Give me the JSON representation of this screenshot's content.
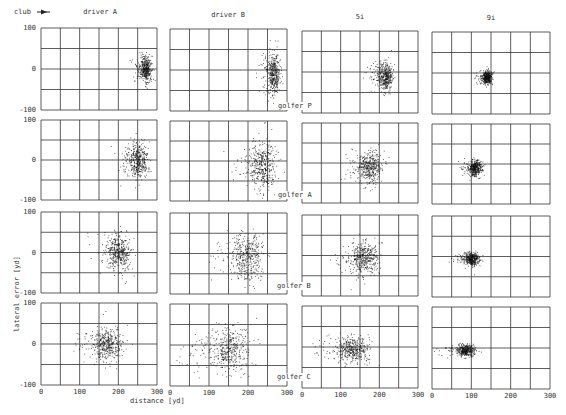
{
  "header": {
    "club_label": "club",
    "club_arrow_icon": "arrow-left-icon"
  },
  "columns": [
    {
      "label": "driver A"
    },
    {
      "label": "driver B"
    },
    {
      "label": "5i"
    },
    {
      "label": "9i"
    }
  ],
  "rows": [
    {
      "label": "golfer P"
    },
    {
      "label": "golfer A"
    },
    {
      "label": "golfer B"
    },
    {
      "label": "golfer C"
    }
  ],
  "axes": {
    "xlabel": "distance [yd]",
    "ylabel": "lateral error [yd]",
    "xticks": [
      "0",
      "100",
      "200",
      "300"
    ],
    "yticks": [
      "100",
      "0",
      "-100"
    ]
  },
  "colors": {
    "grid": "#333333",
    "points": "#111111",
    "background": "#ffffff"
  },
  "chart_data": {
    "type": "scatter",
    "title": "",
    "xlabel": "distance [yd]",
    "ylabel": "lateral error [yd]",
    "xlim": [
      0,
      300
    ],
    "ylim": [
      -100,
      100
    ],
    "x_grid_step": 50,
    "y_grid_step": 50,
    "grid": true,
    "layout": "4x4 small multiples; rows = golfers, columns = clubs",
    "row_labels": [
      "golfer P",
      "golfer A",
      "golfer B",
      "golfer C"
    ],
    "column_labels": [
      "driver A",
      "driver B",
      "5i",
      "9i"
    ],
    "annotations": [
      "club ←"
    ],
    "panels": [
      {
        "golfer": "golfer P",
        "club": "driver A",
        "center_x": 270,
        "center_y": 0,
        "spread_x": 8,
        "spread_y": 15
      },
      {
        "golfer": "golfer P",
        "club": "driver B",
        "center_x": 265,
        "center_y": -10,
        "spread_x": 8,
        "spread_y": 25
      },
      {
        "golfer": "golfer P",
        "club": "5i",
        "center_x": 215,
        "center_y": -10,
        "spread_x": 10,
        "spread_y": 18
      },
      {
        "golfer": "golfer P",
        "club": "9i",
        "center_x": 140,
        "center_y": -10,
        "spread_x": 6,
        "spread_y": 8
      },
      {
        "golfer": "golfer A",
        "club": "driver A",
        "center_x": 250,
        "center_y": 0,
        "spread_x": 12,
        "spread_y": 22
      },
      {
        "golfer": "golfer A",
        "club": "driver B",
        "center_x": 235,
        "center_y": -10,
        "spread_x": 18,
        "spread_y": 30
      },
      {
        "golfer": "golfer A",
        "club": "5i",
        "center_x": 175,
        "center_y": -10,
        "spread_x": 14,
        "spread_y": 22
      },
      {
        "golfer": "golfer A",
        "club": "9i",
        "center_x": 110,
        "center_y": -10,
        "spread_x": 8,
        "spread_y": 10
      },
      {
        "golfer": "golfer B",
        "club": "driver A",
        "center_x": 200,
        "center_y": 0,
        "spread_x": 15,
        "spread_y": 22
      },
      {
        "golfer": "golfer B",
        "club": "driver B",
        "center_x": 195,
        "center_y": -5,
        "spread_x": 20,
        "spread_y": 30
      },
      {
        "golfer": "golfer B",
        "club": "5i",
        "center_x": 160,
        "center_y": -5,
        "spread_x": 18,
        "spread_y": 22
      },
      {
        "golfer": "golfer B",
        "club": "9i",
        "center_x": 100,
        "center_y": -5,
        "spread_x": 10,
        "spread_y": 8
      },
      {
        "golfer": "golfer C",
        "club": "driver A",
        "center_x": 170,
        "center_y": 0,
        "spread_x": 18,
        "spread_y": 20
      },
      {
        "golfer": "golfer C",
        "club": "driver B",
        "center_x": 150,
        "center_y": -10,
        "spread_x": 28,
        "spread_y": 25
      },
      {
        "golfer": "golfer C",
        "club": "5i",
        "center_x": 130,
        "center_y": -5,
        "spread_x": 22,
        "spread_y": 15
      },
      {
        "golfer": "golfer C",
        "club": "9i",
        "center_x": 85,
        "center_y": -5,
        "spread_x": 12,
        "spread_y": 7
      }
    ]
  }
}
